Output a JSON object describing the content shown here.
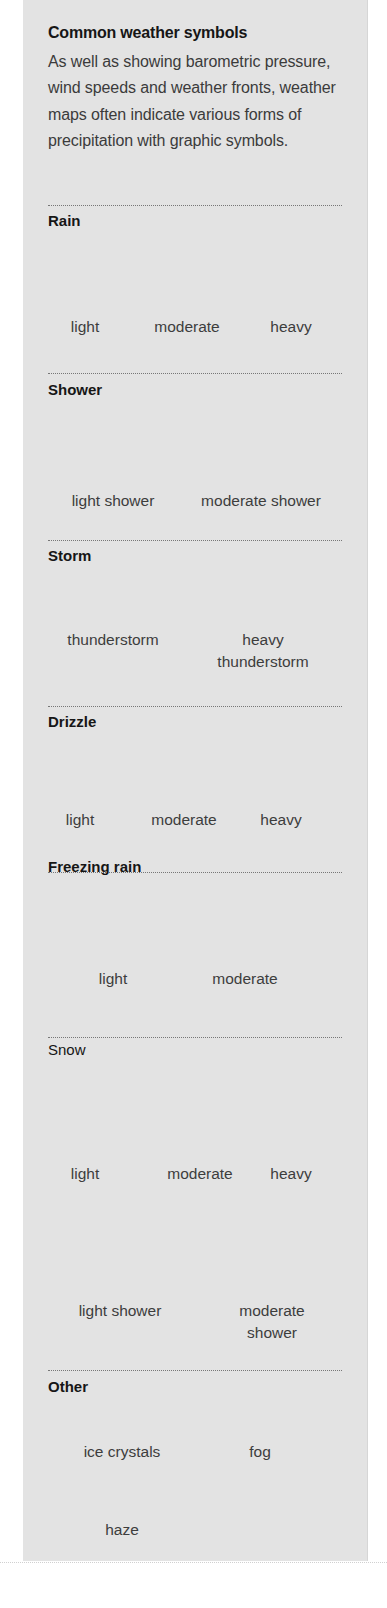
{
  "title": "Common weather symbols",
  "intro": "As well as showing barometric pressure, wind speeds and weather fronts, weather maps often indicate various forms of precipitation with graphic symbols.",
  "sections": {
    "rain": {
      "heading": "Rain",
      "items": [
        {
          "label": "light",
          "icon": "rain-light-icon"
        },
        {
          "label": "moderate",
          "icon": "rain-moderate-icon"
        },
        {
          "label": "heavy",
          "icon": "rain-heavy-icon"
        }
      ]
    },
    "shower": {
      "heading": "Shower",
      "items": [
        {
          "label": "light shower",
          "icon": "shower-light-icon"
        },
        {
          "label": "moderate shower",
          "icon": "shower-moderate-icon"
        }
      ]
    },
    "storm": {
      "heading": "Storm",
      "items": [
        {
          "label": "thunderstorm",
          "icon": "thunderstorm-icon"
        },
        {
          "label_line1": "heavy",
          "label_line2": "thunderstorm",
          "icon": "heavy-thunderstorm-icon"
        }
      ]
    },
    "drizzle": {
      "heading": "Drizzle",
      "items": [
        {
          "label": "light",
          "icon": "drizzle-light-icon"
        },
        {
          "label": "moderate",
          "icon": "drizzle-moderate-icon"
        },
        {
          "label": "heavy",
          "icon": "drizzle-heavy-icon"
        }
      ]
    },
    "freezing_rain": {
      "heading": "Freezing rain",
      "items": [
        {
          "label": "light",
          "icon": "freezing-rain-light-icon"
        },
        {
          "label": "moderate",
          "icon": "freezing-rain-moderate-icon"
        }
      ]
    },
    "snow": {
      "heading": "Snow",
      "items": [
        {
          "label": "light",
          "icon": "snow-light-icon"
        },
        {
          "label": "moderate",
          "icon": "snow-moderate-icon"
        },
        {
          "label": "heavy",
          "icon": "snow-heavy-icon"
        },
        {
          "label": "light shower",
          "icon": "snow-shower-light-icon"
        },
        {
          "label_line1": "moderate",
          "label_line2": "shower",
          "icon": "snow-shower-moderate-icon"
        }
      ]
    },
    "other": {
      "heading": "Other",
      "items": [
        {
          "label": "ice crystals",
          "icon": "ice-crystals-icon"
        },
        {
          "label": "fog",
          "icon": "fog-icon"
        },
        {
          "label": "haze",
          "icon": "haze-icon"
        }
      ]
    }
  },
  "colors": {
    "panel_bg": "#e3e3e3",
    "symbol": "#111111",
    "text": "#3d3d3d"
  }
}
